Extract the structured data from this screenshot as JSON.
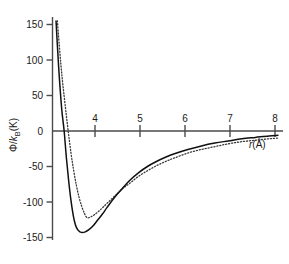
{
  "chart_data": {
    "type": "line",
    "title": "",
    "xlabel": "r(Å)",
    "ylabel": "Φ/k₈(K)",
    "ylabel_parts": {
      "phi": "Φ/",
      "k": "k",
      "b": "B",
      "unit": "(K)"
    },
    "xlabel_parts": {
      "symbol": "r",
      "unit": "(Å)"
    },
    "xlim": [
      3.28,
      8.3
    ],
    "ylim": [
      -160,
      155
    ],
    "xticks": [
      4,
      5,
      6,
      7,
      8
    ],
    "xtick_labels": [
      "4",
      "5",
      "6",
      "7",
      "8"
    ],
    "yticks": [
      150,
      100,
      50,
      0,
      -50,
      -100,
      -150
    ],
    "ytick_labels": [
      "150",
      "100",
      "50",
      "0",
      "-50",
      "-100",
      "-150"
    ],
    "grid": false,
    "legend": "none",
    "axis_color": "#4a4a4a",
    "series": [
      {
        "name": "solid-potential",
        "style": "solid",
        "color": "#101010",
        "minimum": {
          "r": 3.96,
          "phi": -143
        },
        "zero_crossing": 3.55,
        "x": [
          3.37,
          3.4,
          3.43,
          3.46,
          3.5,
          3.55,
          3.6,
          3.65,
          3.7,
          3.75,
          3.8,
          3.85,
          3.9,
          3.96,
          4.02,
          4.1,
          4.2,
          4.3,
          4.4,
          4.5,
          4.65,
          4.8,
          5.0,
          5.2,
          5.4,
          5.6,
          5.8,
          6.0,
          6.3,
          6.6,
          6.9,
          7.2,
          7.5,
          7.8,
          8.1,
          8.3
        ],
        "y": [
          155,
          120,
          88,
          60,
          28,
          0,
          -38,
          -70,
          -97,
          -118,
          -132,
          -139,
          -142,
          -143,
          -142,
          -139,
          -133,
          -125,
          -117,
          -108,
          -95,
          -84,
          -70,
          -59,
          -50,
          -43,
          -37,
          -32,
          -26,
          -21,
          -17,
          -14,
          -11,
          -9,
          -7,
          -6
        ]
      },
      {
        "name": "dotted-potential",
        "style": "dotted",
        "color": "#3a3a3a",
        "minimum": {
          "r": 4.06,
          "phi": -122
        },
        "zero_crossing": 3.64,
        "x": [
          3.4,
          3.44,
          3.48,
          3.52,
          3.57,
          3.64,
          3.7,
          3.76,
          3.82,
          3.88,
          3.94,
          4.0,
          4.06,
          4.14,
          4.22,
          4.32,
          4.42,
          4.55,
          4.7,
          4.85,
          5.0,
          5.2,
          5.4,
          5.6,
          5.8,
          6.0,
          6.3,
          6.6,
          6.9,
          7.2,
          7.5,
          7.8,
          8.1,
          8.3
        ],
        "y": [
          155,
          122,
          92,
          66,
          38,
          0,
          -30,
          -55,
          -76,
          -93,
          -106,
          -116,
          -122,
          -121,
          -118,
          -113,
          -107,
          -99,
          -90,
          -81,
          -74,
          -64,
          -56,
          -49,
          -43,
          -38,
          -31,
          -26,
          -22,
          -18,
          -15,
          -13,
          -11,
          -10
        ]
      }
    ]
  },
  "figure": {
    "background": "#ffffff",
    "plot_left_px": 52,
    "plot_zero_y_px": 131,
    "px_per_x_unit": 45,
    "px_per_100_y": 71
  }
}
